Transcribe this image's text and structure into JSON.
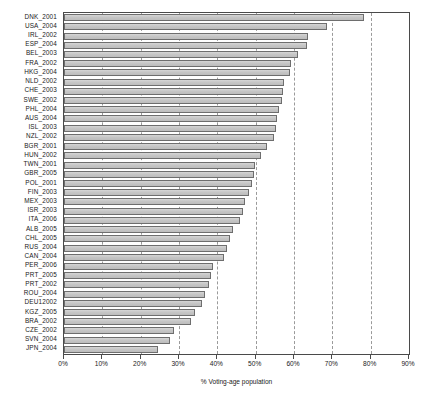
{
  "chart_data": {
    "type": "bar",
    "orientation": "horizontal",
    "title": "",
    "xlabel": "% Voting-age population",
    "ylabel": "",
    "xlim": [
      0,
      90
    ],
    "xticks": [
      0,
      10,
      20,
      30,
      40,
      50,
      60,
      70,
      80,
      90
    ],
    "xtick_labels": [
      "0%",
      "10%",
      "20%",
      "30%",
      "40%",
      "50%",
      "60%",
      "70%",
      "80%",
      "90%"
    ],
    "grid": true,
    "grid_style": "dashed-vertical",
    "legend": null,
    "bar_color": "#c8c8c8",
    "bar_edge_color": "#6e6e6e",
    "categories": [
      "DNK_2001",
      "USA_2004",
      "IRL_2002",
      "ESP_2004",
      "BEL_2003",
      "FRA_2002",
      "HKG_2004",
      "NLD_2002",
      "CHE_2003",
      "SWE_2002",
      "PHL_2004",
      "AUS_2004",
      "ISL_2003",
      "NZL_2002",
      "BGR_2001",
      "HUN_2002",
      "TWN_2001",
      "GBR_2005",
      "POL_2001",
      "FIN_2003",
      "MEX_2003",
      "ISR_2003",
      "ITA_2006",
      "ALB_2005",
      "CHL_2005",
      "RUS_2004",
      "CAN_2004",
      "PER_2006",
      "PRT_2005",
      "PRT_2002",
      "ROU_2004",
      "DEU12002",
      "KGZ_2005",
      "BRA_2002",
      "CZE_2002",
      "SVN_2004",
      "JPN_2004"
    ],
    "values": [
      78.3,
      68.7,
      63.6,
      63.5,
      61.0,
      59.2,
      59.0,
      57.4,
      57.2,
      56.8,
      56.0,
      55.6,
      55.3,
      54.8,
      53.0,
      51.5,
      49.8,
      49.5,
      49.0,
      48.2,
      47.3,
      46.8,
      45.9,
      44.2,
      43.4,
      42.6,
      41.8,
      38.8,
      38.3,
      37.8,
      36.9,
      35.9,
      34.3,
      33.2,
      28.8,
      27.7,
      24.6
    ]
  }
}
